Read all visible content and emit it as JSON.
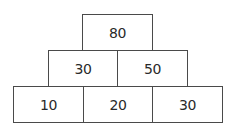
{
  "diagram": {
    "type": "number-pyramid",
    "rows": [
      {
        "level": "top",
        "bricks": [
          {
            "value": "80",
            "x": 82,
            "y": 14,
            "w": 71,
            "h": 37
          }
        ]
      },
      {
        "level": "middle",
        "bricks": [
          {
            "value": "30",
            "x": 48,
            "y": 50,
            "w": 70,
            "h": 37
          },
          {
            "value": "50",
            "x": 117,
            "y": 50,
            "w": 71,
            "h": 37
          }
        ]
      },
      {
        "level": "bottom",
        "bricks": [
          {
            "value": "10",
            "x": 13,
            "y": 86,
            "w": 71,
            "h": 37
          },
          {
            "value": "20",
            "x": 83,
            "y": 86,
            "w": 70,
            "h": 37
          },
          {
            "value": "30",
            "x": 152,
            "y": 86,
            "w": 71,
            "h": 37
          }
        ]
      }
    ],
    "colors": {
      "border": "#4a4a4a",
      "text": "#2a2a2a",
      "background": "#ffffff"
    }
  }
}
